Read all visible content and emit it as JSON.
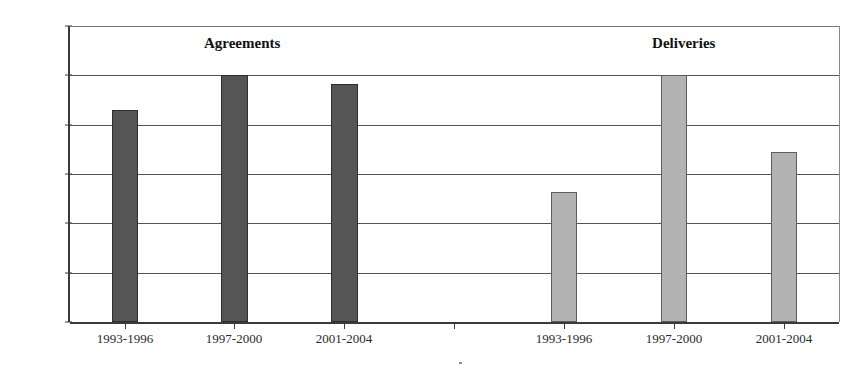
{
  "chart_data": {
    "type": "bar",
    "title": "",
    "xlabel": "",
    "ylabel": "",
    "ylim": [
      0,
      6000
    ],
    "grid": true,
    "legend_position": "none",
    "categories": [
      "1993-1996",
      "1997-2000",
      "2001-2004"
    ],
    "yticks": [
      0,
      1000,
      2000,
      3000,
      4000,
      5000,
      6000
    ],
    "ytick_labels": [
      "0",
      "1000",
      "2000",
      "3000",
      "4000",
      "5000",
      "6000"
    ],
    "group_annotations": [
      {
        "label": "Agreements",
        "x_fraction": 0.223
      },
      {
        "label": "Deliveries",
        "x_fraction": 0.795
      }
    ],
    "series": [
      {
        "name": "Agreements",
        "color": "#555555",
        "values": [
          4300,
          5000,
          4820
        ]
      },
      {
        "name": "Deliveries",
        "color": "#b3b3b3",
        "values": [
          2630,
          5010,
          3450
        ]
      }
    ],
    "bars": [
      {
        "group": "Agreements",
        "category": "1993-1996",
        "value": 4300,
        "style": "dark",
        "left_px": 110,
        "width_px": 26
      },
      {
        "group": "Agreements",
        "category": "1997-2000",
        "value": 5000,
        "style": "dark",
        "left_px": 219,
        "width_px": 27
      },
      {
        "group": "Agreements",
        "category": "2001-2004",
        "value": 4820,
        "style": "dark",
        "left_px": 329,
        "width_px": 27
      },
      {
        "group": "Deliveries",
        "category": "1993-1996",
        "value": 2630,
        "style": "light",
        "left_px": 549,
        "width_px": 26
      },
      {
        "group": "Deliveries",
        "category": "1997-2000",
        "value": 5010,
        "style": "light",
        "left_px": 659,
        "width_px": 26
      },
      {
        "group": "Deliveries",
        "category": "2001-2004",
        "value": 3450,
        "style": "light",
        "left_px": 769,
        "width_px": 26
      }
    ],
    "xtick_positions_px": [
      123,
      232,
      342,
      452,
      562,
      672,
      782
    ],
    "xtick_labels_rendered": [
      "1993-1996",
      "1997-2000",
      "2001-2004",
      "1993-1996",
      "1997-2000",
      "2001-2004"
    ],
    "xtick_label_positions_px": [
      123,
      232,
      342,
      562,
      672,
      782
    ]
  }
}
